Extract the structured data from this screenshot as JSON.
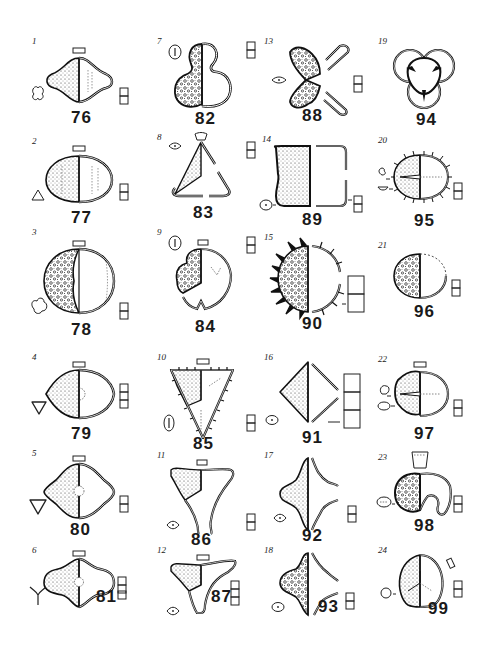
{
  "plate": {
    "background": "#ffffff",
    "ink": "#1a1a1a",
    "layout": {
      "columns": 4,
      "rows": 6
    }
  },
  "figures": [
    {
      "fig": "1",
      "spec": "76",
      "shape": "trilobate-lens",
      "symbol": "three-lobed-outline",
      "scale_boxes": 2
    },
    {
      "fig": "2",
      "spec": "77",
      "shape": "ellipse",
      "symbol": "rounded-triangle",
      "scale_boxes": 2
    },
    {
      "fig": "3",
      "spec": "78",
      "shape": "circle-reticulate",
      "symbol": "trefoil",
      "scale_boxes": 2
    },
    {
      "fig": "4",
      "spec": "79",
      "shape": "lens-pore",
      "symbol": "inverted-triangle",
      "scale_boxes": 3
    },
    {
      "fig": "5",
      "spec": "80",
      "shape": "lens-pointed",
      "symbol": "inverted-triangle",
      "scale_boxes": 2
    },
    {
      "fig": "6",
      "spec": "81",
      "shape": "wavy-lens",
      "symbol": "tri-radiate",
      "scale_boxes": 3
    },
    {
      "fig": "7",
      "spec": "82",
      "shape": "trilobed-verrucate",
      "symbol": "oval-slit",
      "scale_boxes": 2
    },
    {
      "fig": "8",
      "spec": "83",
      "shape": "triangle-open",
      "symbol": "eye-dot",
      "scale_boxes": 2
    },
    {
      "fig": "9",
      "spec": "84",
      "shape": "notched-circle",
      "symbol": "oval-slit",
      "scale_boxes": 2
    },
    {
      "fig": "10",
      "spec": "85",
      "shape": "spiny-triangle",
      "symbol": "oval-slit",
      "scale_boxes": 2
    },
    {
      "fig": "11",
      "spec": "86",
      "shape": "tri-horned",
      "symbol": "eye-dot",
      "scale_boxes": 2
    },
    {
      "fig": "12",
      "spec": "87",
      "shape": "tri-horned-wide",
      "symbol": "eye-dot",
      "scale_boxes": 3
    },
    {
      "fig": "13",
      "spec": "88",
      "shape": "bisaccate-v",
      "symbol": "oval-dot",
      "scale_boxes": 2
    },
    {
      "fig": "14",
      "spec": "89",
      "shape": "rect-bracket",
      "symbol": "oval-dot",
      "scale_boxes": 2
    },
    {
      "fig": "15",
      "spec": "90",
      "shape": "echinate-circle",
      "symbol": "none",
      "scale_boxes": 2
    },
    {
      "fig": "16",
      "spec": "91",
      "shape": "diamond",
      "symbol": "oval-dot",
      "scale_boxes": 3
    },
    {
      "fig": "17",
      "spec": "92",
      "shape": "four-horned",
      "symbol": "eye-dot",
      "scale_boxes": 2
    },
    {
      "fig": "18",
      "spec": "93",
      "shape": "four-horned-verrucate",
      "symbol": "oval-dot",
      "scale_boxes": 2
    },
    {
      "fig": "19",
      "spec": "94",
      "shape": "trisaccate",
      "symbol": "none",
      "scale_boxes": 0
    },
    {
      "fig": "20",
      "spec": "95",
      "shape": "echinate-ellipse",
      "symbol": "two-views",
      "scale_boxes": 2
    },
    {
      "fig": "21",
      "spec": "96",
      "shape": "ellipse-granulate",
      "symbol": "none",
      "scale_boxes": 2
    },
    {
      "fig": "22",
      "spec": "97",
      "shape": "ellipse-rugulate",
      "symbol": "two-views",
      "scale_boxes": 2
    },
    {
      "fig": "23",
      "spec": "98",
      "shape": "reniform",
      "symbol": "oval-dash",
      "scale_boxes": 2
    },
    {
      "fig": "24",
      "spec": "99",
      "shape": "triangular-trilete",
      "symbol": "small-circle",
      "scale_boxes": 2
    }
  ]
}
